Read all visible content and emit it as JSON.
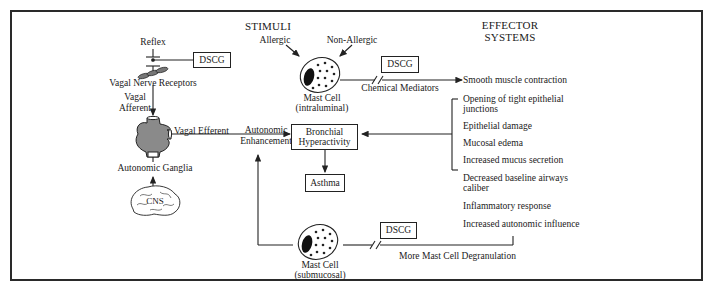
{
  "headers": {
    "stimuli": "STIMULI",
    "effector_line1": "EFFECTOR",
    "effector_line2": "SYSTEMS"
  },
  "left_pathway": {
    "reflex": "Reflex",
    "dscg": "DSCG",
    "vagal_nerve_receptors": "Vagal Nerve Receptors",
    "vagal_afferent_line1": "Vagal",
    "vagal_afferent_line2": "Afferent",
    "vagal_efferent": "Vagal Efferent",
    "autonomic_ganglia": "Autonomic Ganglia",
    "cns": "CNS"
  },
  "center": {
    "allergic": "Allergic",
    "non_allergic": "Non-Allergic",
    "mast_cell_top_line1": "Mast Cell",
    "mast_cell_top_line2": "(intraluminal)",
    "dscg_top": "DSCG",
    "chemical_mediators": "Chemical Mediators",
    "autonomic_enhancement_line1": "Autonomic",
    "autonomic_enhancement_line2": "Enhancement",
    "bronchial_line1": "Bronchial",
    "bronchial_line2": "Hyperactivity",
    "asthma": "Asthma",
    "mast_cell_bottom_line1": "Mast Cell",
    "mast_cell_bottom_line2": "(submucosal)",
    "dscg_bottom": "DSCG",
    "more_degranulation": "More Mast Cell Degranulation"
  },
  "effects": [
    {
      "label": "Smooth muscle contraction"
    },
    {
      "label": "Opening of tight epithelial junctions",
      "line1": "Opening of tight epithelial",
      "line2": "junctions"
    },
    {
      "label": "Epithelial damage"
    },
    {
      "label": "Mucosal edema"
    },
    {
      "label": "Increased mucus secretion"
    },
    {
      "label": "Decreased baseline airways caliber",
      "line1": "Decreased baseline airways",
      "line2": "caliber"
    },
    {
      "label": "Inflammatory response"
    },
    {
      "label": "Increased autonomic influence"
    }
  ],
  "colors": {
    "line": "#222222",
    "ganglia_fill": "#8a8a8a",
    "nucleus": "#111111"
  }
}
